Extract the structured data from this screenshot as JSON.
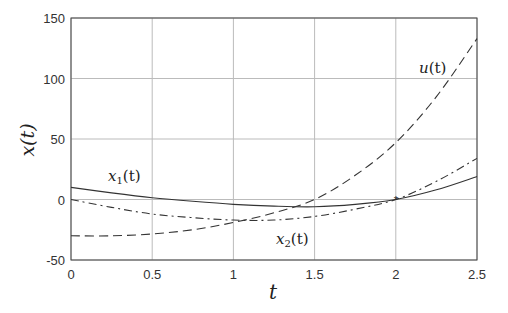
{
  "chart_data": {
    "type": "line",
    "title": "",
    "xlabel": "t",
    "ylabel": "x(t)",
    "xlim": [
      0,
      2.5
    ],
    "ylim": [
      -50,
      150
    ],
    "grid": true,
    "x_ticks": [
      "0",
      "0.5",
      "1",
      "1.5",
      "2",
      "2.5"
    ],
    "y_ticks": [
      "-50",
      "0",
      "50",
      "100",
      "150"
    ],
    "x": [
      0,
      0.25,
      0.5,
      0.75,
      1.0,
      1.25,
      1.5,
      1.75,
      2.0,
      2.25,
      2.5
    ],
    "series": [
      {
        "name": "x1(t)",
        "style": "solid",
        "values": [
          10,
          5.5,
          1.5,
          -1.5,
          -4,
          -5.5,
          -6,
          -4,
          0,
          8,
          19
        ]
      },
      {
        "name": "x2(t)",
        "style": "dashdot",
        "values": [
          0,
          -6.5,
          -12,
          -15,
          -17,
          -17,
          -14,
          -8,
          0,
          15,
          34
        ]
      },
      {
        "name": "u(t)",
        "style": "dashed",
        "values": [
          -30,
          -30,
          -28.5,
          -25,
          -19,
          -11,
          0,
          20,
          47,
          85,
          133
        ]
      }
    ],
    "annotations": [
      {
        "text_main": "x",
        "text_sub": "1",
        "text_tail": "(t)",
        "x": 108,
        "y": 181
      },
      {
        "text_main": "x",
        "text_sub": "2",
        "text_tail": "(t)",
        "x": 276,
        "y": 244
      },
      {
        "text_main": "u",
        "text_sub": "",
        "text_tail": "(t)",
        "x": 419,
        "y": 73
      }
    ]
  },
  "labels": {
    "xlabel": "t",
    "ylabel": "x(t)",
    "x1_main": "x",
    "x1_sub": "1",
    "x1_tail": "(t)",
    "x2_main": "x",
    "x2_sub": "2",
    "x2_tail": "(t)",
    "u_main": "u",
    "u_tail": "(t)"
  }
}
